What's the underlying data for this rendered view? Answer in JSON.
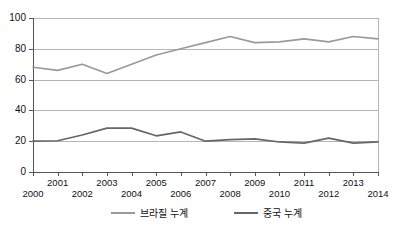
{
  "chart_data": {
    "type": "line",
    "title": "",
    "xlabel": "",
    "ylabel": "",
    "x": [
      2000,
      2001,
      2002,
      2003,
      2004,
      2005,
      2006,
      2007,
      2008,
      2009,
      2010,
      2011,
      2012,
      2013,
      2014
    ],
    "categories": [
      "2000",
      "2001",
      "2002",
      "2003",
      "2004",
      "2005",
      "2006",
      "2007",
      "2008",
      "2009",
      "2010",
      "2011",
      "2012",
      "2013",
      "2014"
    ],
    "series": [
      {
        "name": "브라질 누계",
        "color": "#9a9a9a",
        "values": [
          68,
          66,
          70,
          64,
          70,
          76,
          80,
          84,
          88,
          84,
          84.5,
          86.5,
          84.5,
          88,
          86.5
        ]
      },
      {
        "name": "중국 누계",
        "color": "#666666",
        "values": [
          20,
          20.3,
          24,
          28.5,
          28.5,
          23.5,
          26,
          20,
          21,
          21.5,
          19.5,
          18.8,
          22,
          18.8,
          19.5
        ]
      }
    ],
    "ylim": [
      0,
      100
    ],
    "xlim": [
      2000,
      2014
    ],
    "yticks": [
      0,
      20,
      40,
      60,
      80,
      100
    ],
    "ytick_labels": [
      "0",
      "20",
      "40",
      "60",
      "80",
      "100"
    ],
    "xticks": [
      2000,
      2001,
      2002,
      2003,
      2004,
      2005,
      2006,
      2007,
      2008,
      2009,
      2010,
      2011,
      2012,
      2013,
      2014
    ],
    "xtick_labels_top": [
      "2001",
      "2003",
      "2005",
      "2007",
      "2009",
      "2011",
      "2013"
    ],
    "xtick_labels_bottom": [
      "2000",
      "2002",
      "2004",
      "2006",
      "2008",
      "2010",
      "2012",
      "2014"
    ],
    "grid": true,
    "grid_color": "#b5b5b5",
    "axis_color": "#555555",
    "legend_position": "bottom-center"
  },
  "legend": {
    "entries": [
      {
        "label": "브라질 누계",
        "color": "#9a9a9a"
      },
      {
        "label": "중국 누계",
        "color": "#666666"
      }
    ]
  },
  "axes": {
    "y_labels": [
      "100",
      "80",
      "60",
      "40",
      "20",
      "0"
    ],
    "x_labels_top": [
      "2001",
      "2003",
      "2005",
      "2007",
      "2009",
      "2011",
      "2013"
    ],
    "x_labels_bottom": [
      "2000",
      "2002",
      "2004",
      "2006",
      "2008",
      "2010",
      "2012",
      "2014"
    ]
  }
}
